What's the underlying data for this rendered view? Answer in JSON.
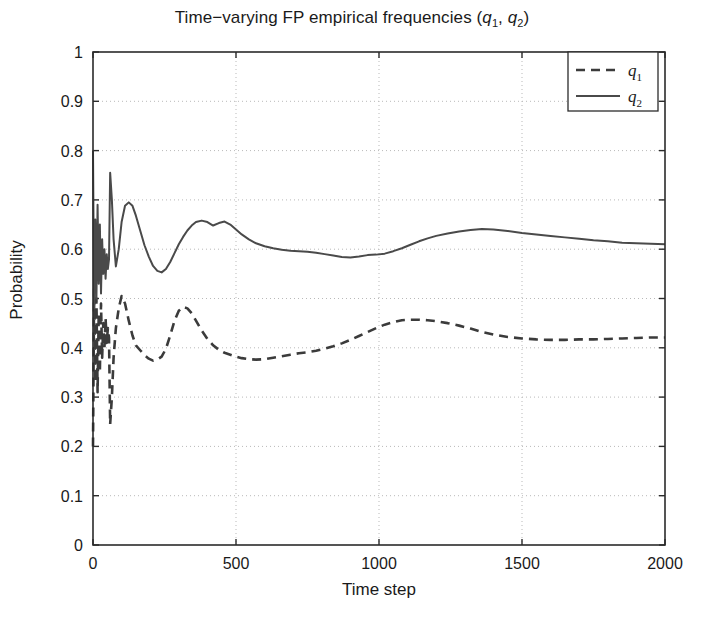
{
  "chart_data": {
    "type": "line",
    "title_parts": {
      "lead": "Time−varying FP empirical frequencies (",
      "sym1": "q",
      "sub1": "1",
      "mid": ", ",
      "sym2": "q",
      "sub2": "2",
      "tail": ")"
    },
    "xlabel": "Time step",
    "ylabel": "Probability",
    "xlim": [
      0,
      2000
    ],
    "ylim": [
      0,
      1
    ],
    "xticks": [
      0,
      500,
      1000,
      1500,
      2000
    ],
    "xticklabels": [
      "0",
      "500",
      "1000",
      "1500",
      "2000"
    ],
    "yticks": [
      0,
      0.1,
      0.2,
      0.3,
      0.4,
      0.5,
      0.6,
      0.7,
      0.8,
      0.9,
      1
    ],
    "yticklabels": [
      "0",
      "0.1",
      "0.2",
      "0.3",
      "0.4",
      "0.5",
      "0.6",
      "0.7",
      "0.8",
      "0.9",
      "1"
    ],
    "grid": true,
    "grid_style": "dotted",
    "grid_color": "#b9b9b9",
    "legend_position": "upper right",
    "legend_entries": [
      {
        "label": "q1",
        "sym": "q",
        "sub": "1",
        "style": "dashed",
        "color": "#3b3b3b"
      },
      {
        "label": "q2",
        "sym": "q",
        "sub": "2",
        "style": "solid",
        "color": "#4a4a4a"
      }
    ],
    "series": [
      {
        "name": "q1",
        "style": "dashed",
        "color": "#3b3b3b",
        "x": [
          0,
          4,
          8,
          12,
          16,
          20,
          24,
          28,
          32,
          36,
          40,
          44,
          48,
          52,
          56,
          60,
          66,
          72,
          80,
          90,
          100,
          112,
          125,
          138,
          150,
          165,
          180,
          195,
          210,
          225,
          240,
          255,
          270,
          285,
          300,
          315,
          330,
          345,
          360,
          380,
          400,
          420,
          440,
          460,
          480,
          500,
          520,
          545,
          570,
          600,
          630,
          660,
          690,
          720,
          750,
          780,
          810,
          840,
          870,
          900,
          930,
          960,
          990,
          1020,
          1050,
          1080,
          1110,
          1140,
          1170,
          1200,
          1240,
          1280,
          1320,
          1360,
          1400,
          1450,
          1500,
          1550,
          1600,
          1650,
          1700,
          1750,
          1800,
          1850,
          1900,
          1950,
          2000
        ],
        "y": [
          0.2,
          0.52,
          0.33,
          0.5,
          0.31,
          0.47,
          0.35,
          0.49,
          0.38,
          0.45,
          0.4,
          0.46,
          0.41,
          0.44,
          0.42,
          0.245,
          0.3,
          0.38,
          0.44,
          0.48,
          0.505,
          0.49,
          0.455,
          0.425,
          0.405,
          0.395,
          0.385,
          0.378,
          0.374,
          0.376,
          0.382,
          0.398,
          0.425,
          0.455,
          0.475,
          0.483,
          0.48,
          0.47,
          0.455,
          0.435,
          0.418,
          0.405,
          0.396,
          0.39,
          0.386,
          0.382,
          0.379,
          0.377,
          0.376,
          0.377,
          0.38,
          0.383,
          0.386,
          0.389,
          0.391,
          0.394,
          0.398,
          0.403,
          0.409,
          0.416,
          0.424,
          0.432,
          0.44,
          0.447,
          0.452,
          0.456,
          0.457,
          0.457,
          0.456,
          0.454,
          0.45,
          0.445,
          0.439,
          0.432,
          0.427,
          0.422,
          0.419,
          0.417,
          0.416,
          0.416,
          0.417,
          0.417,
          0.418,
          0.419,
          0.42,
          0.421,
          0.421
        ]
      },
      {
        "name": "q2",
        "style": "solid",
        "color": "#4a4a4a",
        "x": [
          0,
          4,
          8,
          12,
          16,
          20,
          24,
          28,
          32,
          36,
          40,
          44,
          48,
          52,
          56,
          60,
          66,
          72,
          80,
          90,
          100,
          112,
          125,
          138,
          150,
          165,
          180,
          195,
          210,
          225,
          240,
          255,
          270,
          285,
          300,
          315,
          330,
          345,
          360,
          380,
          400,
          420,
          440,
          460,
          480,
          500,
          520,
          545,
          570,
          600,
          630,
          660,
          690,
          720,
          750,
          780,
          810,
          840,
          870,
          900,
          930,
          960,
          990,
          1020,
          1050,
          1080,
          1110,
          1140,
          1170,
          1200,
          1240,
          1280,
          1320,
          1360,
          1400,
          1450,
          1500,
          1550,
          1600,
          1650,
          1700,
          1750,
          1800,
          1850,
          1900,
          1950,
          2000
        ],
        "y": [
          0.8,
          0.48,
          0.66,
          0.5,
          0.69,
          0.53,
          0.65,
          0.51,
          0.62,
          0.55,
          0.6,
          0.54,
          0.59,
          0.56,
          0.58,
          0.755,
          0.7,
          0.62,
          0.565,
          0.6,
          0.655,
          0.688,
          0.695,
          0.688,
          0.668,
          0.638,
          0.608,
          0.585,
          0.566,
          0.556,
          0.553,
          0.56,
          0.574,
          0.592,
          0.61,
          0.625,
          0.638,
          0.648,
          0.655,
          0.658,
          0.655,
          0.648,
          0.653,
          0.656,
          0.65,
          0.64,
          0.63,
          0.62,
          0.612,
          0.606,
          0.602,
          0.599,
          0.597,
          0.596,
          0.595,
          0.593,
          0.59,
          0.587,
          0.584,
          0.583,
          0.585,
          0.588,
          0.589,
          0.591,
          0.596,
          0.602,
          0.609,
          0.616,
          0.622,
          0.627,
          0.632,
          0.636,
          0.639,
          0.641,
          0.64,
          0.637,
          0.633,
          0.63,
          0.627,
          0.624,
          0.621,
          0.618,
          0.616,
          0.613,
          0.612,
          0.611,
          0.61
        ]
      }
    ]
  },
  "axes": {
    "frame_color": "#2b2b2b",
    "background": "#ffffff"
  }
}
